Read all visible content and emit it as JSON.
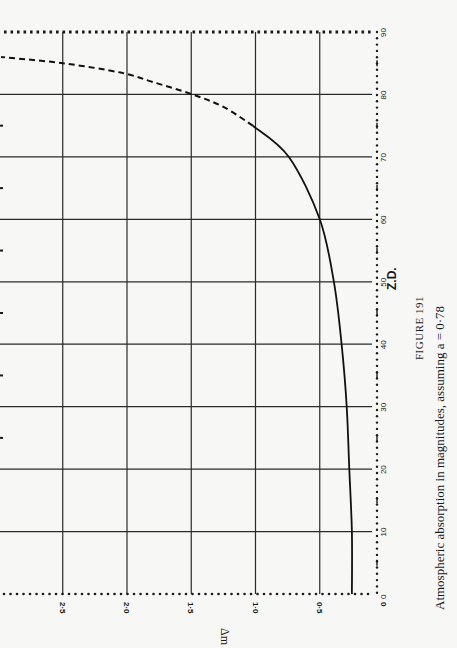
{
  "figure": {
    "number_label": "FIGURE 191",
    "caption": "Atmospheric absorption in magnitudes, assuming a = 0·78"
  },
  "chart_data": {
    "type": "line",
    "title": "FIGURE 191",
    "subtitle": "Atmospheric absorption in magnitudes, assuming a = 0·78",
    "xlabel": "Z.D.",
    "ylabel": "Δm",
    "orientation": "rotated 90° counter-clockwise on page (Z.D. axis runs bottom-to-top on right; Δm axis runs right-to-left at bottom)",
    "xlim": [
      0,
      90
    ],
    "ylim": [
      0,
      3.0
    ],
    "x_ticks": [
      "0",
      "10",
      "20",
      "30",
      "40",
      "50",
      "60",
      "70",
      "80",
      "90"
    ],
    "y_ticks": [
      "0",
      "0·5",
      "1·0",
      "1·5",
      "2·0",
      "2·5"
    ],
    "grid": true,
    "legend": null,
    "series": [
      {
        "name": "Δm (solid)",
        "style": "solid",
        "x": [
          0,
          10,
          20,
          30,
          40,
          50,
          60,
          70,
          75
        ],
        "y": [
          0.25,
          0.25,
          0.27,
          0.29,
          0.33,
          0.39,
          0.5,
          0.74,
          1.02
        ]
      },
      {
        "name": "Δm (dashed extrapolation)",
        "style": "dashed",
        "x": [
          75,
          78,
          80,
          82,
          83.5,
          85,
          86
        ],
        "y": [
          1.02,
          1.25,
          1.49,
          1.8,
          2.05,
          2.5,
          2.98
        ]
      }
    ]
  }
}
